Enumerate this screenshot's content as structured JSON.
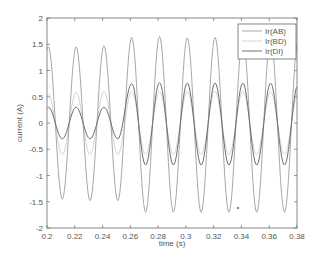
{
  "chart_data": {
    "type": "line",
    "title": "",
    "xlabel": "time (s)",
    "ylabel": "current (A)",
    "xlim": [
      0.2,
      0.38
    ],
    "ylim": [
      -2,
      2
    ],
    "xticks": [
      "0.2",
      "0.22",
      "0.24",
      "0.26",
      "0.28",
      "0.3",
      "0.32",
      "0.34",
      "0.36",
      "0.38"
    ],
    "yticks": [
      "2",
      "1.5",
      "1",
      "0.5",
      "0",
      "-0.5",
      "-1",
      "-1.5",
      "-2"
    ],
    "grid": false,
    "legend_position": "upper right",
    "frequency_hz": 50,
    "series": [
      {
        "name": "Ir(AB)",
        "color": "#a8a8a8",
        "description": "sinusoid, peaks near t=0.201+0.02k",
        "peaks": [
          {
            "t": 0.201,
            "v": 1.45
          },
          {
            "t": 0.221,
            "v": 1.45
          },
          {
            "t": 0.241,
            "v": 1.47
          },
          {
            "t": 0.261,
            "v": 1.63
          },
          {
            "t": 0.281,
            "v": 1.65
          },
          {
            "t": 0.301,
            "v": 1.62
          },
          {
            "t": 0.321,
            "v": 1.63
          },
          {
            "t": 0.341,
            "v": 1.63
          },
          {
            "t": 0.361,
            "v": 1.63
          }
        ],
        "troughs": [
          {
            "t": 0.211,
            "v": -1.45
          },
          {
            "t": 0.231,
            "v": -1.48
          },
          {
            "t": 0.251,
            "v": -1.48
          },
          {
            "t": 0.271,
            "v": -1.7
          },
          {
            "t": 0.291,
            "v": -1.7
          },
          {
            "t": 0.311,
            "v": -1.7
          },
          {
            "t": 0.331,
            "v": -1.7
          },
          {
            "t": 0.351,
            "v": -1.7
          },
          {
            "t": 0.371,
            "v": -1.7
          }
        ]
      },
      {
        "name": "Ir(BD)",
        "color": "#d4d4d4",
        "description": "low-amplitude sinusoid in phase with Ir(AB)",
        "peaks": [
          {
            "t": 0.201,
            "v": 0.55
          },
          {
            "t": 0.221,
            "v": 0.58
          },
          {
            "t": 0.241,
            "v": 0.6
          },
          {
            "t": 0.261,
            "v": 0.6
          },
          {
            "t": 0.281,
            "v": 0.6
          },
          {
            "t": 0.301,
            "v": 0.6
          },
          {
            "t": 0.321,
            "v": 0.6
          },
          {
            "t": 0.341,
            "v": 0.6
          },
          {
            "t": 0.361,
            "v": 0.6
          }
        ],
        "troughs": [
          {
            "t": 0.211,
            "v": -0.6
          },
          {
            "t": 0.231,
            "v": -0.6
          },
          {
            "t": 0.251,
            "v": -0.6
          },
          {
            "t": 0.271,
            "v": -0.6
          },
          {
            "t": 0.291,
            "v": -0.6
          },
          {
            "t": 0.311,
            "v": -0.6
          },
          {
            "t": 0.331,
            "v": -0.6
          },
          {
            "t": 0.351,
            "v": -0.6
          },
          {
            "t": 0.371,
            "v": -0.6
          }
        ]
      },
      {
        "name": "Ir(DI)",
        "color": "#6e6e6e",
        "description": "small sinusoid until ~0.26 s then larger amplitude",
        "peaks": [
          {
            "t": 0.201,
            "v": 0.3
          },
          {
            "t": 0.221,
            "v": 0.3
          },
          {
            "t": 0.241,
            "v": 0.3
          },
          {
            "t": 0.261,
            "v": 0.75
          },
          {
            "t": 0.281,
            "v": 0.77
          },
          {
            "t": 0.301,
            "v": 0.76
          },
          {
            "t": 0.321,
            "v": 0.76
          },
          {
            "t": 0.341,
            "v": 0.76
          },
          {
            "t": 0.361,
            "v": 0.76
          }
        ],
        "troughs": [
          {
            "t": 0.211,
            "v": -0.3
          },
          {
            "t": 0.231,
            "v": -0.3
          },
          {
            "t": 0.251,
            "v": -0.3
          },
          {
            "t": 0.271,
            "v": -0.8
          },
          {
            "t": 0.291,
            "v": -0.8
          },
          {
            "t": 0.311,
            "v": -0.8
          },
          {
            "t": 0.331,
            "v": -0.8
          },
          {
            "t": 0.351,
            "v": -0.8
          },
          {
            "t": 0.371,
            "v": -0.8
          }
        ]
      }
    ]
  },
  "legend": {
    "items": [
      {
        "label": "Ir(AB)",
        "color": "#a8a8a8"
      },
      {
        "label": "Ir(BD)",
        "color": "#d4d4d4"
      },
      {
        "label": "Ir(DI)",
        "color": "#6e6e6e"
      }
    ]
  },
  "axes": {
    "xlabel": "time (s)",
    "ylabel": "current (A)"
  }
}
